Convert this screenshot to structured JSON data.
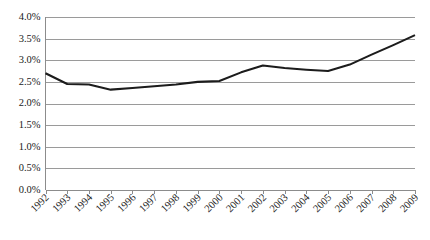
{
  "chart_data": {
    "type": "line",
    "title": "",
    "subtitle": "",
    "xlabel": "",
    "ylabel": "",
    "categories": [
      "1992",
      "1993",
      "1994",
      "1995",
      "1996",
      "1997",
      "1998",
      "1999",
      "2000",
      "2001",
      "2002",
      "2003",
      "2004",
      "2005",
      "2006",
      "2007",
      "2008",
      "2009"
    ],
    "x": [
      1992,
      1993,
      1994,
      1995,
      1996,
      1997,
      1998,
      1999,
      2000,
      2001,
      2002,
      2003,
      2004,
      2005,
      2006,
      2007,
      2008,
      2009
    ],
    "values": [
      2.7,
      2.45,
      2.44,
      2.32,
      2.36,
      2.4,
      2.44,
      2.5,
      2.52,
      2.72,
      2.88,
      2.82,
      2.78,
      2.75,
      2.9,
      3.13,
      3.35,
      3.58
    ],
    "series": [
      {
        "name": "series-1",
        "values": [
          2.7,
          2.45,
          2.44,
          2.32,
          2.36,
          2.4,
          2.44,
          2.5,
          2.52,
          2.72,
          2.88,
          2.82,
          2.78,
          2.75,
          2.9,
          3.13,
          3.35,
          3.58
        ],
        "color": "#1c1c1c"
      }
    ],
    "ylim": [
      0.0,
      4.0
    ],
    "ytick_values": [
      0.0,
      0.5,
      1.0,
      1.5,
      2.0,
      2.5,
      3.0,
      3.5,
      4.0
    ],
    "ytick_labels": [
      "0.0%",
      "0.5%",
      "1.0%",
      "1.5%",
      "2.0%",
      "2.5%",
      "3.0%",
      "3.5%",
      "4.0%"
    ],
    "xtick_labels": [
      "1992",
      "1993",
      "1994",
      "1995",
      "1996",
      "1997",
      "1998",
      "1999",
      "2000",
      "2001",
      "2002",
      "2003",
      "2004",
      "2005",
      "2006",
      "2007",
      "2008",
      "2009"
    ],
    "grid": true,
    "grid_axis": "y",
    "grid_color": "#9a9a9a",
    "legend": false,
    "legend_position": "none",
    "annotations": [],
    "xtick_label_rotation": 45,
    "value_format": "percent",
    "background_color": "#ffffff"
  }
}
